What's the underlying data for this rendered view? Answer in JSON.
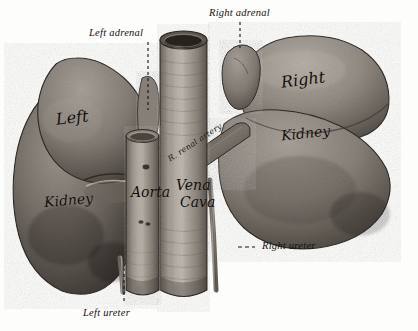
{
  "figure": {
    "medium": "monochrome halftone engraving",
    "background_color": "#fdfdfc",
    "ink_color": "#100d0a"
  },
  "captions": [
    {
      "id": "right-adrenal",
      "text": "Right adrenal",
      "x": 209,
      "y": 8,
      "leader": "dashed-down"
    },
    {
      "id": "left-adrenal",
      "text": "Left adrenal",
      "x": 89,
      "y": 28,
      "leader": "dashed-down"
    },
    {
      "id": "right-ureter",
      "text": "Right ureter",
      "x": 275,
      "y": 242,
      "leader": "dashed-left"
    },
    {
      "id": "left-ureter",
      "text": "Left ureter",
      "x": 83,
      "y": 310,
      "leader": "dashed-up"
    }
  ],
  "ink_labels": [
    {
      "id": "left-word",
      "text": "Left",
      "x": 56,
      "y": 117,
      "size": "lg",
      "rotate": -6
    },
    {
      "id": "left-kidney-word",
      "text": "Kidney",
      "x": 44,
      "y": 198,
      "size": "md",
      "rotate": -5
    },
    {
      "id": "right-word",
      "text": "Right",
      "x": 281,
      "y": 79,
      "size": "lg",
      "rotate": -7
    },
    {
      "id": "right-kidney-word",
      "text": "Kidney",
      "x": 281,
      "y": 133,
      "size": "md",
      "rotate": -6
    },
    {
      "id": "aorta",
      "text": "Aorta",
      "x": 134,
      "y": 192,
      "size": "md",
      "rotate": 0
    },
    {
      "id": "vena",
      "text": "Vena",
      "x": 178,
      "y": 184,
      "size": "md",
      "rotate": 0
    },
    {
      "id": "cava",
      "text": "Cava",
      "x": 182,
      "y": 201,
      "size": "md",
      "rotate": 0
    },
    {
      "id": "renal-artery",
      "text": "R. renal artery",
      "x": 168,
      "y": 156,
      "size": "tiny",
      "rotate": -33
    }
  ],
  "structures": [
    {
      "id": "left-kidney",
      "label": "Left kidney",
      "tone": "#6c6560"
    },
    {
      "id": "left-adrenal",
      "label": "Left adrenal gland",
      "tone": "#807a74"
    },
    {
      "id": "right-kidney",
      "label": "Right kidney",
      "tone": "#8a837c"
    },
    {
      "id": "right-adrenal",
      "label": "Right adrenal gland",
      "tone": "#8e8880"
    },
    {
      "id": "aorta",
      "label": "Aorta",
      "tone": "#9a948c"
    },
    {
      "id": "vena-cava",
      "label": "Inferior vena cava",
      "tone": "#a19a92"
    },
    {
      "id": "renal-artery",
      "label": "Right renal artery",
      "tone": "#6e675f"
    },
    {
      "id": "left-ureter",
      "label": "Left ureter",
      "tone": "#8d867e"
    },
    {
      "id": "right-ureter",
      "label": "Right ureter",
      "tone": "#8d867e"
    }
  ]
}
